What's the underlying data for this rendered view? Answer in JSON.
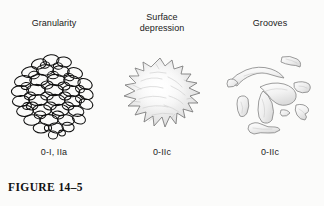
{
  "figure": {
    "label": "FIGURE 14–5",
    "background_color": "#fbfbfa",
    "ink_color": "#1a1a1a"
  },
  "panels": [
    {
      "title": "Granularity",
      "caption": "0-I, IIa",
      "illustration_name": "granularity-cluster-of-granules",
      "illustration_description": "Rounded cluster of many overlapping oval granules drawn in black outline"
    },
    {
      "title": "Surface\ndepression",
      "caption": "0-IIc",
      "illustration_name": "surface-depression-jagged-blob",
      "illustration_description": "Irregular star-edged blob with soft gray shading indicating a depressed surface"
    },
    {
      "title": "Grooves",
      "caption": "0-IIc",
      "illustration_name": "grooves-irregular-bands",
      "illustration_description": "Several elongated irregular outlined bands with light gray shading representing grooves"
    }
  ]
}
